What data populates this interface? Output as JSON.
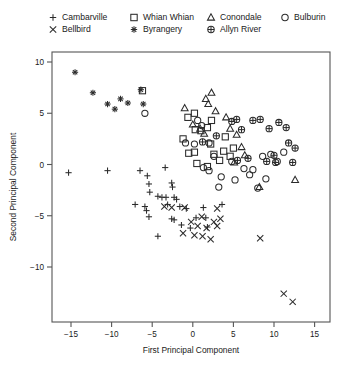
{
  "figure": {
    "background": "#ffffff",
    "ink_color": "#1a1a1a",
    "frame_color": "#555555"
  },
  "axes": {
    "xlabel": "First  Principal  Component",
    "ylabel": "Second Principal Component",
    "xticks": [
      "−15",
      "−10",
      "−5",
      "0",
      "5",
      "10",
      "15"
    ],
    "yticks": [
      "10",
      "5",
      "0",
      "−5",
      "−10"
    ],
    "xlim": [
      -17.5,
      17.0
    ],
    "ylim": [
      -14.5,
      11.5
    ],
    "grid": false
  },
  "legend": {
    "position": "top-outside",
    "rows": [
      [
        {
          "label": "Cambarville",
          "marker": "plus"
        },
        {
          "label": "Whian Whian",
          "marker": "open-square"
        },
        {
          "label": "Conondale",
          "marker": "open-triangle"
        },
        {
          "label": "Bulburin",
          "marker": "open-circle"
        }
      ],
      [
        {
          "label": "Bellbird",
          "marker": "cross"
        },
        {
          "label": "Byrangery",
          "marker": "asterisk"
        },
        {
          "label": "Allyn River",
          "marker": "crossed-circle"
        }
      ]
    ]
  },
  "chart_data": {
    "type": "scatter",
    "title": "",
    "xlabel": "First  Principal  Component",
    "ylabel": "Second Principal Component",
    "xlim": [
      -17.5,
      17.0
    ],
    "ylim": [
      -14.5,
      11.5
    ],
    "xticks": [
      -15,
      -10,
      -5,
      0,
      5,
      10,
      15
    ],
    "yticks": [
      -10,
      -5,
      0,
      5,
      10
    ],
    "grid": false,
    "legend_position": "top-outside",
    "series": [
      {
        "name": "Cambarville",
        "marker": "plus",
        "points": [
          [
            -15.3,
            -0.8
          ],
          [
            -10.5,
            -0.6
          ],
          [
            -6.5,
            -0.6
          ],
          [
            -5.6,
            -1.1
          ],
          [
            -5.4,
            -1.9
          ],
          [
            -5.3,
            -2.7
          ],
          [
            -3.4,
            -0.3
          ],
          [
            -2.6,
            -1.8
          ],
          [
            -2.5,
            -2.2
          ],
          [
            -2.3,
            -3.2
          ],
          [
            -7.1,
            -3.9
          ],
          [
            -5.9,
            -4.1
          ],
          [
            -5.7,
            -4.5
          ],
          [
            -5.4,
            -5.1
          ],
          [
            -4.3,
            -3.1
          ],
          [
            -3.8,
            -3.2
          ],
          [
            -3.3,
            -3.2
          ],
          [
            -3.1,
            -3.9
          ],
          [
            -2.0,
            -3.4
          ],
          [
            -1.6,
            -4.1
          ],
          [
            -2.6,
            -5.3
          ],
          [
            -2.3,
            -5.4
          ],
          [
            -1.4,
            -5.9
          ],
          [
            -0.8,
            -4.3
          ],
          [
            -0.3,
            -6.2
          ],
          [
            0.4,
            -5.2
          ],
          [
            1.3,
            -4.2
          ],
          [
            1.6,
            -5.2
          ],
          [
            -4.3,
            -7.0
          ],
          [
            1.8,
            -6.1
          ],
          [
            3.6,
            -3.9
          ]
        ]
      },
      {
        "name": "Bellbird",
        "marker": "cross",
        "points": [
          [
            -2.6,
            -4.2
          ],
          [
            -1.0,
            -4.2
          ],
          [
            -0.2,
            -5.6
          ],
          [
            0.6,
            -6.0
          ],
          [
            1.1,
            -5.1
          ],
          [
            1.7,
            -6.2
          ],
          [
            2.6,
            -5.6
          ],
          [
            3.0,
            -6.0
          ],
          [
            3.4,
            -5.3
          ],
          [
            -1.2,
            -6.7
          ],
          [
            0.2,
            -6.9
          ],
          [
            1.2,
            -7.0
          ],
          [
            2.2,
            -7.3
          ],
          [
            8.3,
            -7.2
          ],
          [
            11.2,
            -12.6
          ],
          [
            12.3,
            -13.4
          ],
          [
            3.0,
            -4.3
          ],
          [
            -3.5,
            -4.1
          ]
        ]
      },
      {
        "name": "Whian Whian",
        "marker": "open-square",
        "points": [
          [
            -6.2,
            7.2
          ],
          [
            -0.6,
            4.6
          ],
          [
            0.2,
            5.0
          ],
          [
            -1.2,
            2.5
          ],
          [
            0.3,
            3.4
          ],
          [
            -0.5,
            1.1
          ],
          [
            0.2,
            1.2
          ],
          [
            1.0,
            3.3
          ],
          [
            1.8,
            3.6
          ],
          [
            2.3,
            4.3
          ],
          [
            0.5,
            0.1
          ],
          [
            1.8,
            -0.2
          ],
          [
            2.6,
            1.0
          ],
          [
            3.3,
            0.4
          ],
          [
            3.8,
            1.3
          ],
          [
            4.6,
            0.8
          ],
          [
            5.0,
            1.6
          ],
          [
            2.2,
            2.0
          ],
          [
            4.0,
            2.7
          ]
        ]
      },
      {
        "name": "Byrangery",
        "marker": "asterisk",
        "points": [
          [
            -14.5,
            9.0
          ],
          [
            -12.3,
            7.0
          ],
          [
            -10.5,
            5.9
          ],
          [
            -9.6,
            5.4
          ],
          [
            -8.9,
            6.4
          ],
          [
            -8.0,
            6.0
          ],
          [
            -6.4,
            7.3
          ],
          [
            -6.1,
            5.9
          ]
        ]
      },
      {
        "name": "Conondale",
        "marker": "open-triangle",
        "points": [
          [
            -1.0,
            5.5
          ],
          [
            1.6,
            6.4
          ],
          [
            2.3,
            7.0
          ],
          [
            1.9,
            5.9
          ],
          [
            2.8,
            5.2
          ],
          [
            0.0,
            3.9
          ],
          [
            0.9,
            3.5
          ],
          [
            1.4,
            3.0
          ],
          [
            4.1,
            4.6
          ],
          [
            4.6,
            3.5
          ],
          [
            5.4,
            2.9
          ],
          [
            6.0,
            1.7
          ],
          [
            6.4,
            0.9
          ],
          [
            5.1,
            0.2
          ],
          [
            12.6,
            -1.5
          ],
          [
            8.2,
            -2.2
          ]
        ]
      },
      {
        "name": "Allyn River",
        "marker": "crossed-circle",
        "points": [
          [
            4.8,
            4.2
          ],
          [
            5.4,
            4.4
          ],
          [
            6.0,
            3.4
          ],
          [
            2.9,
            2.8
          ],
          [
            1.2,
            2.2
          ],
          [
            7.4,
            4.3
          ],
          [
            8.3,
            4.4
          ],
          [
            9.4,
            3.5
          ],
          [
            10.6,
            4.1
          ],
          [
            11.5,
            3.6
          ],
          [
            11.8,
            2.1
          ],
          [
            12.6,
            1.6
          ],
          [
            10.0,
            0.9
          ],
          [
            9.1,
            0.3
          ],
          [
            10.2,
            0.2
          ],
          [
            5.5,
            0.4
          ],
          [
            6.8,
            0.6
          ],
          [
            12.3,
            0.2
          ]
        ]
      },
      {
        "name": "Bulburin",
        "marker": "open-circle",
        "points": [
          [
            -5.9,
            5.0
          ],
          [
            0.6,
            4.3
          ],
          [
            1.1,
            3.8
          ],
          [
            -0.9,
            2.1
          ],
          [
            0.2,
            2.0
          ],
          [
            2.0,
            2.1
          ],
          [
            2.6,
            0.8
          ],
          [
            1.3,
            -0.3
          ],
          [
            2.0,
            -0.6
          ],
          [
            3.5,
            -1.2
          ],
          [
            4.8,
            0.3
          ],
          [
            6.3,
            -0.4
          ],
          [
            7.0,
            -1.0
          ],
          [
            7.4,
            -0.5
          ],
          [
            8.6,
            0.8
          ],
          [
            9.6,
            1.0
          ],
          [
            10.4,
            0.3
          ],
          [
            11.2,
            1.2
          ],
          [
            8.0,
            -2.3
          ],
          [
            5.2,
            -1.5
          ],
          [
            3.2,
            -2.2
          ],
          [
            9.0,
            -1.4
          ]
        ]
      }
    ]
  }
}
